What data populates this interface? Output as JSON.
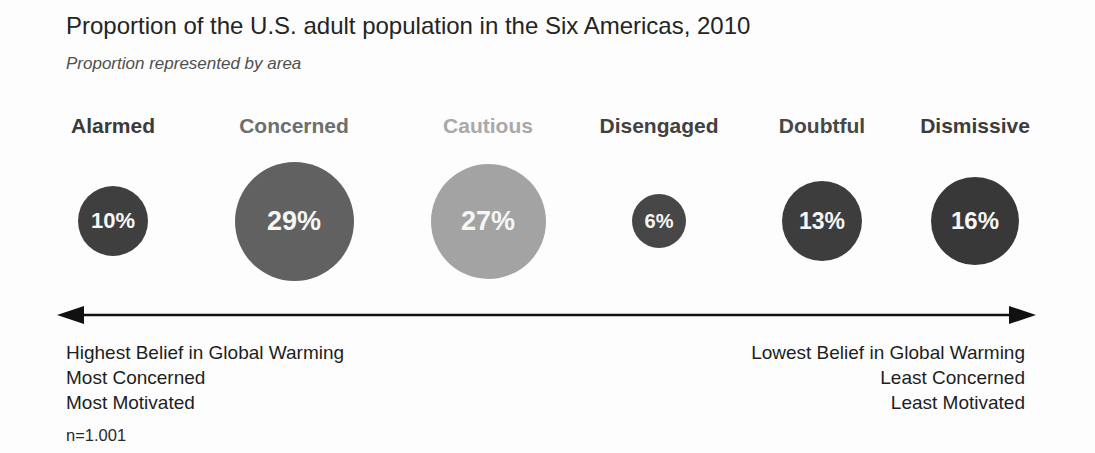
{
  "chart_data": {
    "type": "bubble",
    "title": "Proportion of the U.S. adult population in the Six Americas, 2010",
    "subtitle": "Proportion represented by area",
    "encoding_note": "circle area proportional to percentage of population",
    "categories": [
      "Alarmed",
      "Concerned",
      "Cautious",
      "Disengaged",
      "Doubtful",
      "Dismissive"
    ],
    "values": [
      10,
      29,
      27,
      6,
      13,
      16
    ],
    "value_labels": [
      "10%",
      "29%",
      "27%",
      "6%",
      "13%",
      "16%"
    ],
    "value_unit": "%",
    "segment_colors": [
      "#3f3f3f",
      "#616161",
      "#a3a3a3",
      "#474747",
      "#3d3d3d",
      "#383838"
    ],
    "label_colors": [
      "#3a3a3a",
      "#6e6e6e",
      "#a9a9a9",
      "#414141",
      "#474747",
      "#3c3c3c"
    ],
    "value_text_color": "#f6f6f6",
    "arrow_color": "#111111",
    "axis_annotation": {
      "left_lines": [
        "Highest Belief in Global Warming",
        "Most Concerned",
        "Most Motivated"
      ],
      "right_lines": [
        "Lowest Belief in Global Warming",
        "Least Concerned",
        "Least Motivated"
      ]
    },
    "sample_note": "n=1.001",
    "layout": {
      "centers_x": [
        113,
        294,
        488,
        659,
        822,
        975
      ],
      "center_y": 221,
      "diameter_scale": 22.1,
      "arrow_x1": 57,
      "arrow_x2": 1036
    }
  }
}
